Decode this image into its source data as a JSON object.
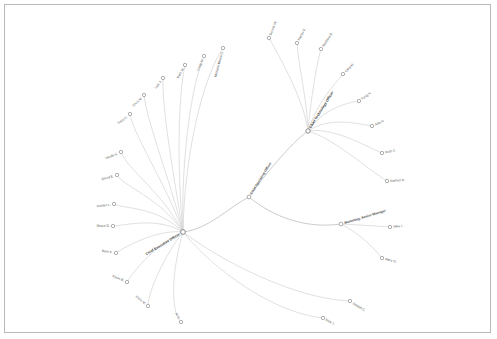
{
  "canvas": {
    "width": 497,
    "height": 339,
    "background": "#ffffff",
    "border_color": "#b9b9b9"
  },
  "graph": {
    "type": "radial-dendrogram",
    "edge_color": "#d2d2d2",
    "node_fill": "#ffffff",
    "node_stroke": "#8d8d8d",
    "hubs": [
      {
        "id": "ceo",
        "label": "Chief Executive Officer",
        "x": 182,
        "y": 231,
        "r": 2.4,
        "angle": -31,
        "anchor": "end",
        "kind": "hub"
      },
      {
        "id": "cto",
        "label": "Chief Technology Officer",
        "x": 307,
        "y": 130,
        "r": 2.2,
        "angle": -58,
        "anchor": "start",
        "kind": "hub"
      },
      {
        "id": "ops",
        "label": "Chief Operating Officer",
        "x": 248,
        "y": 196,
        "r": 1.9,
        "angle": -58,
        "anchor": "start",
        "kind": "mid"
      },
      {
        "id": "mktg",
        "label": "Marketing, Senior Manager",
        "x": 340,
        "y": 223,
        "r": 1.9,
        "angle": -17,
        "anchor": "start",
        "kind": "mid"
      }
    ],
    "leaves": [
      {
        "label": "Michelle Moore D.",
        "x": 222,
        "y": 47,
        "angle": -75,
        "anchor": "end",
        "parent": "ceo"
      },
      {
        "label": "Craig M.",
        "x": 203,
        "y": 55,
        "angle": -66,
        "anchor": "end",
        "parent": "ceo"
      },
      {
        "label": "Beth W.",
        "x": 184,
        "y": 64,
        "angle": -60,
        "anchor": "end",
        "parent": "ceo"
      },
      {
        "label": "Luis J.",
        "x": 162,
        "y": 77,
        "angle": -52,
        "anchor": "end",
        "parent": "ceo"
      },
      {
        "label": "Chris M.",
        "x": 143,
        "y": 94,
        "angle": -45,
        "anchor": "end",
        "parent": "ceo"
      },
      {
        "label": "Tracy C.",
        "x": 129,
        "y": 113,
        "angle": -38,
        "anchor": "end",
        "parent": "ceo"
      },
      {
        "label": "Nicole C.",
        "x": 120,
        "y": 151,
        "angle": -22,
        "anchor": "end",
        "parent": "ceo"
      },
      {
        "label": "David E.",
        "x": 116,
        "y": 174,
        "angle": -15,
        "anchor": "end",
        "parent": "ceo"
      },
      {
        "label": "Kristen L.",
        "x": 113,
        "y": 203,
        "angle": -7,
        "anchor": "end",
        "parent": "ceo"
      },
      {
        "label": "Grace D.",
        "x": 112,
        "y": 225,
        "angle": 0,
        "anchor": "end",
        "parent": "ceo"
      },
      {
        "label": "Beth K.",
        "x": 115,
        "y": 252,
        "angle": 10,
        "anchor": "end",
        "parent": "ceo"
      },
      {
        "label": "Kevin B.",
        "x": 126,
        "y": 281,
        "angle": 24,
        "anchor": "end",
        "parent": "ceo"
      },
      {
        "label": "Chris M.",
        "x": 147,
        "y": 305,
        "angle": 40,
        "anchor": "end",
        "parent": "ceo"
      },
      {
        "label": "Al S.",
        "x": 180,
        "y": 321,
        "angle": 62,
        "anchor": "end",
        "parent": "ceo"
      },
      {
        "label": "Rick J.",
        "x": 322,
        "y": 317,
        "angle": 28,
        "anchor": "start",
        "parent": "ceo"
      },
      {
        "label": "Joseph C.",
        "x": 349,
        "y": 300,
        "angle": 32,
        "anchor": "start",
        "parent": "ceo"
      },
      {
        "label": "Dennis W.",
        "x": 268,
        "y": 37,
        "angle": -68,
        "anchor": "start",
        "parent": "cto"
      },
      {
        "label": "Hector E.",
        "x": 296,
        "y": 42,
        "angle": -62,
        "anchor": "start",
        "parent": "cto"
      },
      {
        "label": "Matthew R.",
        "x": 320,
        "y": 48,
        "angle": -56,
        "anchor": "start",
        "parent": "cto"
      },
      {
        "label": "Cara M.",
        "x": 342,
        "y": 73,
        "angle": -45,
        "anchor": "start",
        "parent": "cto"
      },
      {
        "label": "Feng K.",
        "x": 358,
        "y": 100,
        "angle": -36,
        "anchor": "start",
        "parent": "cto"
      },
      {
        "label": "Ada H.",
        "x": 371,
        "y": 125,
        "angle": -25,
        "anchor": "start",
        "parent": "cto"
      },
      {
        "label": "Ruth C.",
        "x": 381,
        "y": 152,
        "angle": -12,
        "anchor": "start",
        "parent": "cto"
      },
      {
        "label": "Nathan K.",
        "x": 386,
        "y": 180,
        "angle": -4,
        "anchor": "start",
        "parent": "cto"
      },
      {
        "label": "Mike I.",
        "x": 389,
        "y": 226,
        "angle": -6,
        "anchor": "start",
        "parent": "mktg"
      },
      {
        "label": "Mary G.",
        "x": 381,
        "y": 257,
        "angle": 14,
        "anchor": "start",
        "parent": "mktg"
      }
    ],
    "edges": [
      {
        "from": "ceo",
        "to_x": 222,
        "to_y": 47,
        "c1x": 183,
        "c1y": 160,
        "c2x": 200,
        "c2y": 80,
        "main": false
      },
      {
        "from": "ceo",
        "to_x": 203,
        "to_y": 55,
        "c1x": 180,
        "c1y": 165,
        "c2x": 189,
        "c2y": 88,
        "main": false
      },
      {
        "from": "ceo",
        "to_x": 184,
        "to_y": 64,
        "c1x": 176,
        "c1y": 168,
        "c2x": 177,
        "c2y": 96,
        "main": false
      },
      {
        "from": "ceo",
        "to_x": 162,
        "to_y": 77,
        "c1x": 172,
        "c1y": 172,
        "c2x": 161,
        "c2y": 107,
        "main": false
      },
      {
        "from": "ceo",
        "to_x": 143,
        "to_y": 94,
        "c1x": 168,
        "c1y": 176,
        "c2x": 146,
        "c2y": 121,
        "main": false
      },
      {
        "from": "ceo",
        "to_x": 129,
        "to_y": 113,
        "c1x": 164,
        "c1y": 180,
        "c2x": 134,
        "c2y": 138,
        "main": false
      },
      {
        "from": "ceo",
        "to_x": 120,
        "to_y": 151,
        "c1x": 160,
        "c1y": 190,
        "c2x": 126,
        "c2y": 168,
        "main": false
      },
      {
        "from": "ceo",
        "to_x": 116,
        "to_y": 174,
        "c1x": 158,
        "c1y": 196,
        "c2x": 123,
        "c2y": 186,
        "main": false
      },
      {
        "from": "ceo",
        "to_x": 113,
        "to_y": 203,
        "c1x": 156,
        "c1y": 205,
        "c2x": 122,
        "c2y": 208,
        "main": false
      },
      {
        "from": "ceo",
        "to_x": 112,
        "to_y": 225,
        "c1x": 155,
        "c1y": 215,
        "c2x": 122,
        "c2y": 225,
        "main": false
      },
      {
        "from": "ceo",
        "to_x": 115,
        "to_y": 252,
        "c1x": 156,
        "c1y": 228,
        "c2x": 124,
        "c2y": 246,
        "main": false
      },
      {
        "from": "ceo",
        "to_x": 126,
        "to_y": 281,
        "c1x": 159,
        "c1y": 240,
        "c2x": 132,
        "c2y": 270,
        "main": false
      },
      {
        "from": "ceo",
        "to_x": 147,
        "to_y": 305,
        "c1x": 165,
        "c1y": 252,
        "c2x": 147,
        "c2y": 290,
        "main": false
      },
      {
        "from": "ceo",
        "to_x": 180,
        "to_y": 321,
        "c1x": 172,
        "c1y": 265,
        "c2x": 168,
        "c2y": 308,
        "main": false
      },
      {
        "from": "ceo",
        "to_x": 322,
        "to_y": 317,
        "c1x": 212,
        "c1y": 268,
        "c2x": 272,
        "c2y": 312,
        "main": false
      },
      {
        "from": "ceo",
        "to_x": 349,
        "to_y": 300,
        "c1x": 220,
        "c1y": 260,
        "c2x": 294,
        "c2y": 298,
        "main": false
      },
      {
        "from": "cto",
        "to_x": 268,
        "to_y": 37,
        "c1x": 303,
        "c1y": 100,
        "c2x": 281,
        "c2y": 60,
        "main": false
      },
      {
        "from": "cto",
        "to_x": 296,
        "to_y": 42,
        "c1x": 306,
        "c1y": 98,
        "c2x": 297,
        "c2y": 62,
        "main": false
      },
      {
        "from": "cto",
        "to_x": 320,
        "to_y": 48,
        "c1x": 310,
        "c1y": 98,
        "c2x": 315,
        "c2y": 66,
        "main": false
      },
      {
        "from": "cto",
        "to_x": 342,
        "to_y": 73,
        "c1x": 316,
        "c1y": 102,
        "c2x": 333,
        "c2y": 84,
        "main": false
      },
      {
        "from": "cto",
        "to_x": 358,
        "to_y": 100,
        "c1x": 322,
        "c1y": 108,
        "c2x": 345,
        "c2y": 102,
        "main": false
      },
      {
        "from": "cto",
        "to_x": 371,
        "to_y": 125,
        "c1x": 328,
        "c1y": 116,
        "c2x": 354,
        "c2y": 122,
        "main": false
      },
      {
        "from": "cto",
        "to_x": 381,
        "to_y": 152,
        "c1x": 332,
        "c1y": 126,
        "c2x": 362,
        "c2y": 144,
        "main": false
      },
      {
        "from": "cto",
        "to_x": 386,
        "to_y": 180,
        "c1x": 334,
        "c1y": 138,
        "c2x": 366,
        "c2y": 168,
        "main": false
      },
      {
        "from": "mktg",
        "to_x": 389,
        "to_y": 226,
        "c1x": 360,
        "c1y": 224,
        "c2x": 374,
        "c2y": 225,
        "main": false
      },
      {
        "from": "mktg",
        "to_x": 381,
        "to_y": 257,
        "c1x": 358,
        "c1y": 232,
        "c2x": 372,
        "c2y": 246,
        "main": false
      },
      {
        "from": "ceo",
        "to_x": 248,
        "to_y": 196,
        "c1x": 208,
        "c1y": 228,
        "c2x": 228,
        "c2y": 206,
        "main": true
      },
      {
        "from": "ops",
        "to_x": 307,
        "to_y": 130,
        "c1x": 262,
        "c1y": 176,
        "c2x": 290,
        "c2y": 142,
        "main": true
      },
      {
        "from": "ops",
        "to_x": 340,
        "to_y": 223,
        "c1x": 272,
        "c1y": 216,
        "c2x": 305,
        "c2y": 228,
        "main": true
      }
    ]
  }
}
